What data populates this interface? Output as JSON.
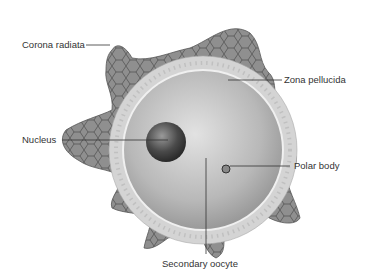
{
  "diagram": {
    "labels": {
      "corona_radiata": "Corona radiata",
      "zona_pellucida": "Zona pellucida",
      "nucleus": "Nucleus",
      "polar_body": "Polar body",
      "secondary_oocyte": "Secondary oocyte"
    },
    "colors": {
      "corona": "#8a8a8a",
      "zona": "#cfcfcf",
      "cytoplasm": "#b5b5b5",
      "nucleus": "#4a4a4a",
      "text": "#333333"
    }
  }
}
